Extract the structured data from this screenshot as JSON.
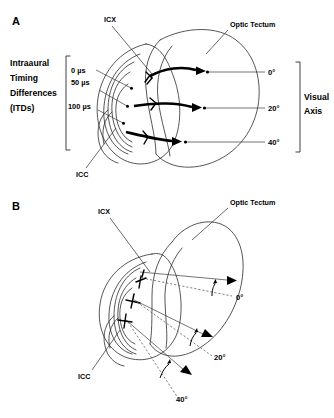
{
  "figure": {
    "background_color": "#ffffff",
    "ink_color": "#000000",
    "width": 334,
    "height": 418
  },
  "panels": [
    {
      "id": "A",
      "label": "A",
      "structures": [
        {
          "key": "icx",
          "label": "ICX"
        },
        {
          "key": "icc",
          "label": "ICC"
        },
        {
          "key": "optic_tectum",
          "label": "Optic Tectum"
        }
      ],
      "left_axis": {
        "title_lines": [
          "Intraaural",
          "Timing",
          "Differences",
          "(ITDs)"
        ],
        "ticks": [
          {
            "value": "0 µs"
          },
          {
            "value": "50 µs"
          },
          {
            "value": "100 µs"
          }
        ]
      },
      "right_axis": {
        "title_lines": [
          "Visual",
          "Axis"
        ],
        "ticks": [
          {
            "value": "0°"
          },
          {
            "value": "20°"
          },
          {
            "value": "40°"
          }
        ]
      }
    },
    {
      "id": "B",
      "label": "B",
      "structures": [
        {
          "key": "icx",
          "label": "ICX"
        },
        {
          "key": "icc",
          "label": "ICC"
        },
        {
          "key": "optic_tectum",
          "label": "Optic Tectum"
        }
      ],
      "right_axis": {
        "ticks": [
          {
            "value": "0°"
          },
          {
            "value": "20°"
          },
          {
            "value": "40°"
          }
        ]
      }
    }
  ]
}
